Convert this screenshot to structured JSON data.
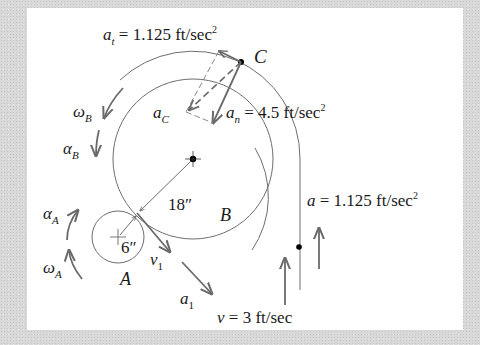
{
  "figure": {
    "labels": {
      "at": {
        "sym": "a",
        "sub": "t",
        "eq": " = 1.125 ft/sec",
        "sup": "2"
      },
      "an": {
        "sym": "a",
        "sub": "n",
        "eq": " = 4.5 ft/sec",
        "sup": "2"
      },
      "ac": {
        "sym": "a",
        "sub": "C"
      },
      "point_c": "C",
      "omega_b": {
        "sym": "ω",
        "sub": "B"
      },
      "alpha_b": {
        "sym": "α",
        "sub": "B"
      },
      "alpha_a": {
        "sym": "α",
        "sub": "A"
      },
      "omega_a": {
        "sym": "ω",
        "sub": "A"
      },
      "radius_b": "18″",
      "radius_a": "6″",
      "wheel_b": "B",
      "wheel_a": "A",
      "v1": {
        "sym": "v",
        "sub": "1"
      },
      "a1": {
        "sym": "a",
        "sub": "1"
      },
      "a_load": {
        "sym": "a",
        "eq": " = 1.125 ft/sec",
        "sup": "2"
      },
      "v_load": {
        "sym": "v",
        "eq": " = 3 ft/sec"
      }
    },
    "colors": {
      "line": "#6e6e6e",
      "arrow": "#6a6a6a",
      "dot": "#000000",
      "panel": "#ffffff"
    }
  }
}
